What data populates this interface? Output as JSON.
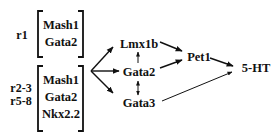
{
  "diagram": {
    "groups": [
      {
        "region_labels": [
          "r1"
        ],
        "genes": [
          "Mash1",
          "Gata2"
        ]
      },
      {
        "region_labels": [
          "r2-3",
          "r5-8"
        ],
        "genes": [
          "Mash1",
          "Gata2",
          "Nkx2.2"
        ]
      }
    ],
    "nodes": {
      "lmx1b": "Lmx1b",
      "gata2": "Gata2",
      "gata3": "Gata3",
      "pet1": "Pet1",
      "serotonin": "5-HT"
    },
    "edges": [
      {
        "from": "groups",
        "to": "Lmx1b",
        "type": "arrow"
      },
      {
        "from": "groups",
        "to": "Gata2",
        "type": "arrow"
      },
      {
        "from": "groups",
        "to": "Gata3",
        "type": "arrow"
      },
      {
        "from": "Gata2",
        "to": "Lmx1b",
        "type": "arrow"
      },
      {
        "from": "Gata2",
        "to": "Gata3",
        "type": "double-arrow"
      },
      {
        "from": "Lmx1b",
        "to": "Pet1",
        "type": "arrow"
      },
      {
        "from": "Gata2",
        "to": "Pet1",
        "type": "arrow"
      },
      {
        "from": "Pet1",
        "to": "5-HT",
        "type": "arrow"
      },
      {
        "from": "Gata3",
        "to": "5-HT",
        "type": "arrow"
      }
    ]
  }
}
